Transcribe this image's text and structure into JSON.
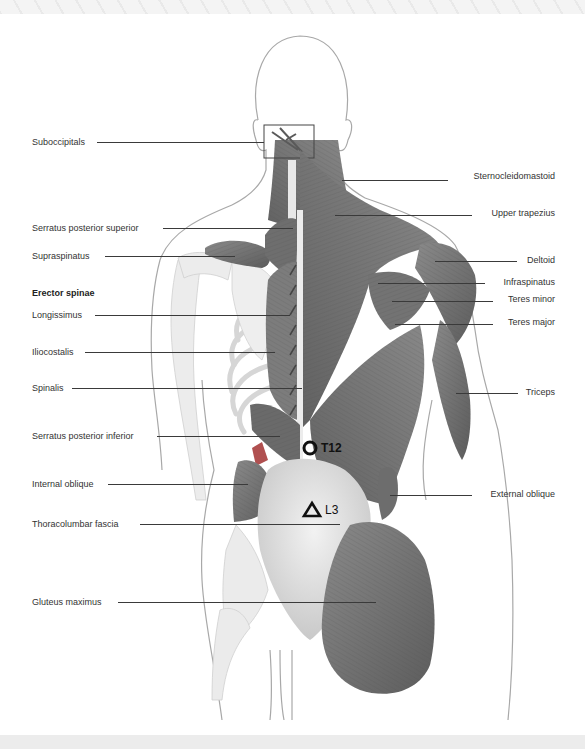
{
  "diagram": {
    "colors": {
      "muscle": "#7a7a7a",
      "muscle_dark": "#5e5e5e",
      "skin_outline": "#a8a8a8",
      "bone": "#e6e6e6",
      "fascia": "#d8d8d8",
      "accent_red": "#b05050",
      "marker": "#111111",
      "label_text": "#333333",
      "leader_line": "#3a3a3a"
    },
    "left_labels": [
      {
        "text": "Suboccipitals",
        "y": 142
      },
      {
        "text": "Serratus posterior superior",
        "y": 228
      },
      {
        "text": "Supraspinatus",
        "y": 256
      },
      {
        "text": "Erector spinae",
        "y": 293,
        "heading": true
      },
      {
        "text": "Longissimus",
        "y": 315
      },
      {
        "text": "Iliocostalis",
        "y": 352
      },
      {
        "text": "Spinalis",
        "y": 388
      },
      {
        "text": "Serratus posterior inferior",
        "y": 436
      },
      {
        "text": "Internal oblique",
        "y": 484
      },
      {
        "text": "Thoracolumbar fascia",
        "y": 524
      },
      {
        "text": "Gluteus maximus",
        "y": 602
      }
    ],
    "right_labels": [
      {
        "text": "Sternocleidomastoid",
        "y": 176
      },
      {
        "text": "Upper trapezius",
        "y": 213
      },
      {
        "text": "Deltoid",
        "y": 260
      },
      {
        "text": "Infraspinatus",
        "y": 282
      },
      {
        "text": "Teres minor",
        "y": 299
      },
      {
        "text": "Teres major",
        "y": 322
      },
      {
        "text": "Triceps",
        "y": 392
      },
      {
        "text": "External oblique",
        "y": 494
      }
    ],
    "markers": [
      {
        "symbol": "circle",
        "label": "T12"
      },
      {
        "symbol": "triangle",
        "label": "L3"
      }
    ]
  }
}
